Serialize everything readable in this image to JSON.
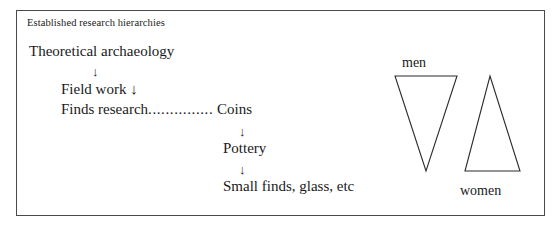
{
  "figure": {
    "title": "Established research hierarchies",
    "border_color": "#4a4a4a",
    "background_color": "#ffffff",
    "text_color": "#1a1a1a"
  },
  "hierarchy": {
    "nodes": [
      {
        "label": "Theoretical archaeology"
      },
      {
        "label": "Field work"
      },
      {
        "label": "Finds research"
      },
      {
        "label": "Coins"
      },
      {
        "label": "Pottery"
      },
      {
        "label": "Small finds, glass, etc"
      }
    ],
    "arrow_glyph": "↓",
    "leader_dots": "...............",
    "field_work_inline_arrow": "↓"
  },
  "triangles": {
    "men": {
      "label": "men",
      "orientation": "inverted",
      "label_position": "above",
      "stroke_color": "#2b2b2b"
    },
    "women": {
      "label": "women",
      "orientation": "upright",
      "label_position": "below",
      "stroke_color": "#2b2b2b"
    }
  }
}
